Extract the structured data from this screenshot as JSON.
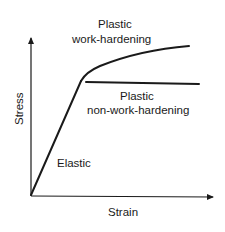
{
  "diagram": {
    "type": "stress-strain curve",
    "axes": {
      "x_label": "Strain",
      "y_label": "Stress"
    },
    "regions": [
      {
        "name": "elastic",
        "label": "Elastic"
      },
      {
        "name": "plastic-work-hardening",
        "label_line1": "Plastic",
        "label_line2": "work-hardening"
      },
      {
        "name": "plastic-non-work-hardening",
        "label_line1": "Plastic",
        "label_line2": "non-work-hardening"
      }
    ],
    "colors": {
      "line": "#1a1a1a",
      "background": "#ffffff"
    }
  }
}
